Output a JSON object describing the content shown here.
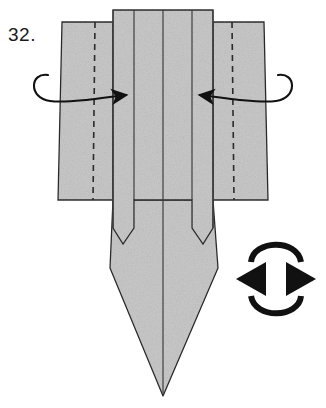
{
  "page": {
    "background_color": "#ffffff",
    "width": 326,
    "height": 408
  },
  "step": {
    "label": "32.",
    "number": 32
  },
  "figure": {
    "name": "origami-model",
    "paper_fill_color": "#c9c9c9",
    "paper_edge_color": "#2b2b2b",
    "fold_line_color": "#2b2b2b",
    "crease_line_color": "#3a3a3a"
  },
  "annotations": {
    "arrows": [
      {
        "name": "fold-arrow-left",
        "direction": "right",
        "style": "loop-fold-over",
        "color": "#111111"
      },
      {
        "name": "fold-arrow-right",
        "direction": "left",
        "style": "loop-fold-over",
        "color": "#111111"
      }
    ],
    "symbols": [
      {
        "name": "turn-over-symbol",
        "meaning": "turn the model over",
        "color": "#111111"
      }
    ],
    "fold_lines": [
      {
        "name": "valley-fold-left",
        "style": "dashed"
      },
      {
        "name": "valley-fold-right",
        "style": "dashed"
      }
    ]
  }
}
